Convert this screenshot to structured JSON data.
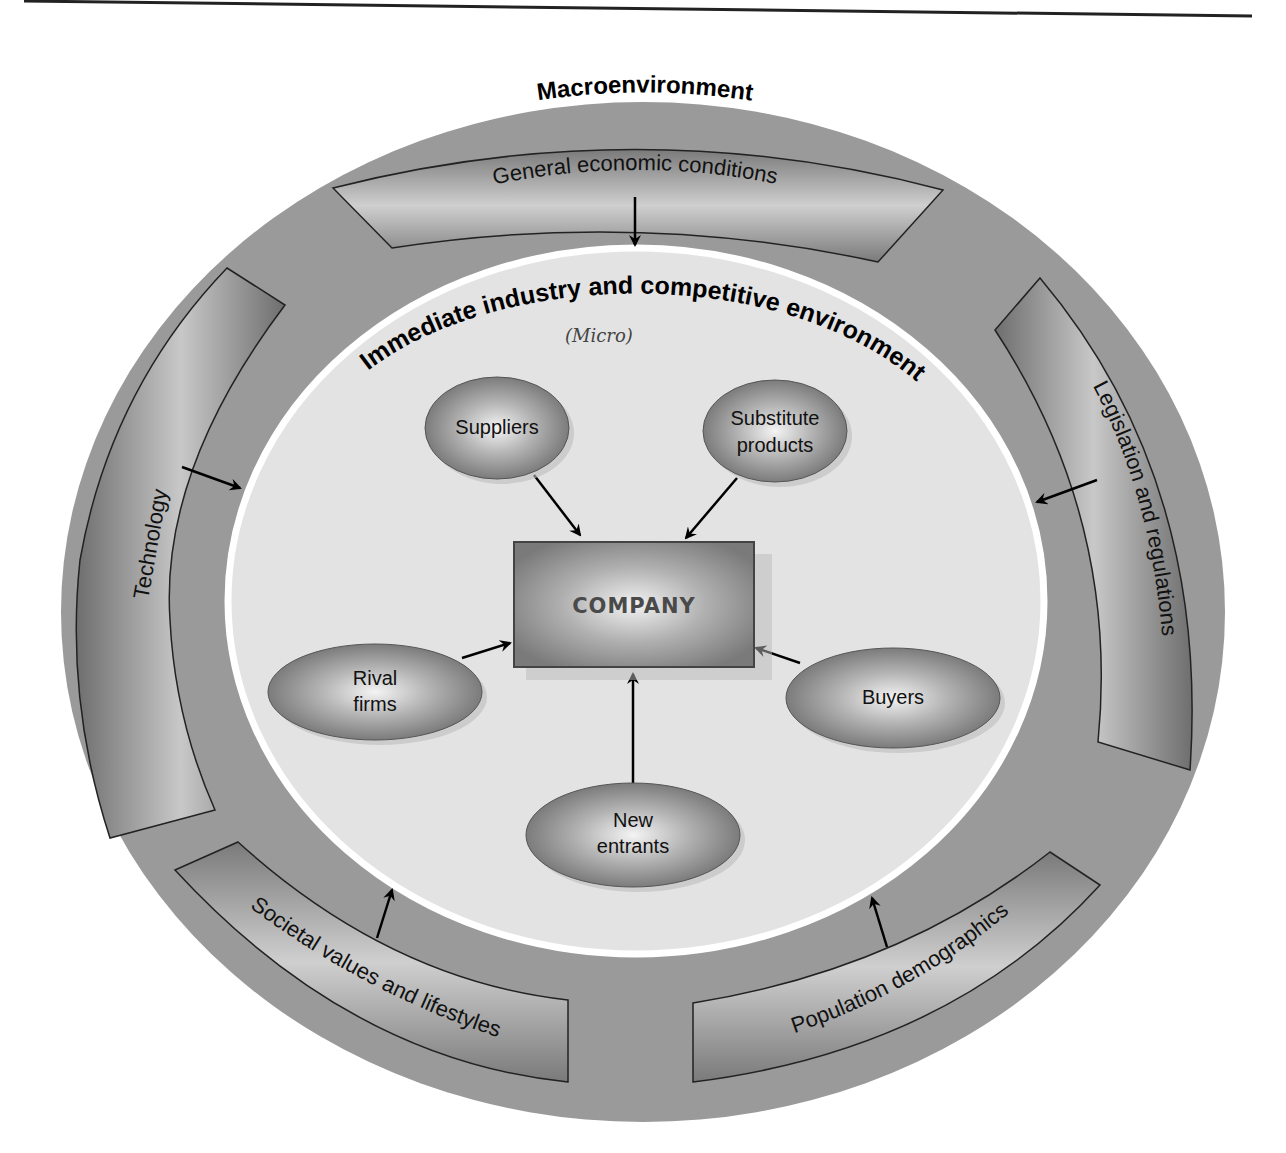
{
  "diagram": {
    "outer_title": "Macroenvironment",
    "inner_title": "Immediate industry and competitive environment",
    "handwritten_note": "(Micro)",
    "center": {
      "label": "COMPANY"
    },
    "macro_factors": [
      {
        "id": "economic",
        "label": "General economic conditions",
        "position": "top"
      },
      {
        "id": "technology",
        "label": "Technology",
        "position": "left"
      },
      {
        "id": "legislation",
        "label": "Legislation and regulations",
        "position": "right"
      },
      {
        "id": "societal",
        "label": "Societal values and lifestyles",
        "position": "bottom-left"
      },
      {
        "id": "demographics",
        "label": "Population demographics",
        "position": "bottom-right"
      }
    ],
    "micro_forces": [
      {
        "id": "suppliers",
        "lines": [
          "Suppliers"
        ]
      },
      {
        "id": "substitutes",
        "lines": [
          "Substitute",
          "products"
        ]
      },
      {
        "id": "rivals",
        "lines": [
          "Rival",
          "firms"
        ]
      },
      {
        "id": "buyers",
        "lines": [
          "Buyers"
        ]
      },
      {
        "id": "new_entrants",
        "lines": [
          "New",
          "entrants"
        ]
      }
    ],
    "colors": {
      "outer_ring": "#9a9a9a",
      "inner_circle": "#e3e3e3",
      "inner_border": "#ffffff",
      "band_fill": "#8c8c8c",
      "node_fill": "#8f8f8f",
      "arrow": "#000000"
    }
  }
}
